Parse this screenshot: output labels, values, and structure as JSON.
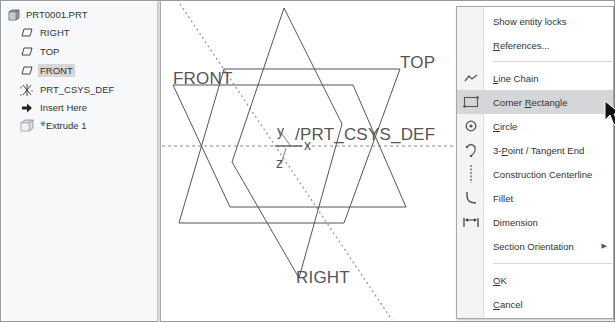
{
  "model_tree": {
    "items": [
      {
        "label": "PRT0001.PRT",
        "icon": "part-icon",
        "selected": false
      },
      {
        "label": "RIGHT",
        "icon": "datum-plane-icon",
        "selected": false
      },
      {
        "label": "TOP",
        "icon": "datum-plane-icon",
        "selected": false
      },
      {
        "label": "FRONT",
        "icon": "datum-plane-icon",
        "selected": true
      },
      {
        "label": "PRT_CSYS_DEF",
        "icon": "coordinate-system-icon",
        "selected": false
      },
      {
        "label": "Insert Here",
        "icon": "insert-arrow-icon",
        "selected": false
      },
      {
        "label": "Extrude 1",
        "icon": "extrude-icon",
        "selected": false,
        "prefix": "※"
      }
    ]
  },
  "graphics": {
    "planes": [
      "FRONT",
      "TOP",
      "RIGHT"
    ],
    "csys_label": "PRT_CSYS_DEF",
    "axes": {
      "x": "x",
      "y": "y",
      "z": "z"
    }
  },
  "context_menu": {
    "items": [
      {
        "label": "Show entity locks",
        "mnemonic": "",
        "icon": ""
      },
      {
        "label": "References...",
        "mnemonic": "R",
        "icon": ""
      },
      {
        "label": "Line Chain",
        "mnemonic": "L",
        "icon": "line-chain-icon"
      },
      {
        "label": "Corner Rectangle",
        "mnemonic": "R",
        "icon": "corner-rectangle-icon",
        "hover": true
      },
      {
        "label": "Circle",
        "mnemonic": "C",
        "icon": "circle-icon"
      },
      {
        "label": "3-Point / Tangent End",
        "mnemonic": "P",
        "icon": "arc-icon"
      },
      {
        "label": "Construction Centerline",
        "mnemonic": "",
        "icon": "centerline-icon"
      },
      {
        "label": "Fillet",
        "mnemonic": "",
        "icon": "fillet-icon"
      },
      {
        "label": "Dimension",
        "mnemonic": "",
        "icon": "dimension-icon"
      },
      {
        "label": "Section Orientation",
        "mnemonic": "",
        "icon": "",
        "submenu": true
      },
      {
        "label": "OK",
        "mnemonic": "O",
        "icon": ""
      },
      {
        "label": "Cancel",
        "mnemonic": "C",
        "icon": ""
      }
    ]
  },
  "colors": {
    "hover": "#d5d6d8",
    "selected": "#d6d6d6",
    "datum_line": "#555555"
  }
}
